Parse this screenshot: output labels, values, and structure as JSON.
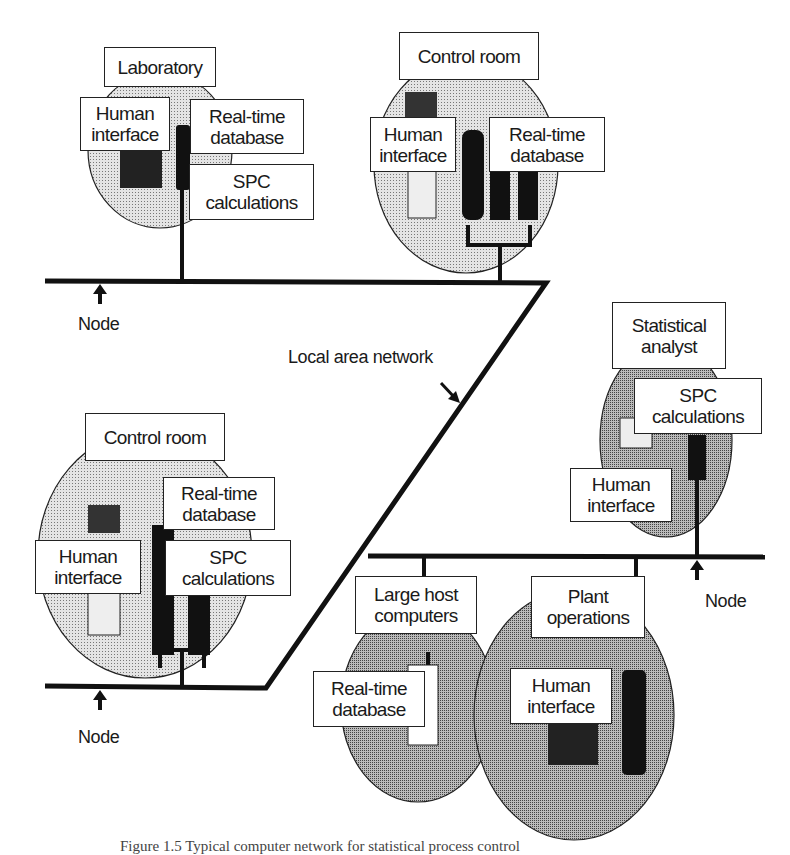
{
  "figure": {
    "colors": {
      "line": "#111111",
      "fill_light": "#c8c8c8",
      "fill_dark": "#8c8c8c",
      "label_bg": "#ffffff"
    },
    "network": {
      "label": "Local area network"
    },
    "nodes": [
      {
        "label": "Node"
      },
      {
        "label": "Node"
      },
      {
        "label": "Node"
      }
    ],
    "sites": {
      "laboratory": {
        "title": "Laboratory",
        "components": [
          "Human\ninterface",
          "Real-time\ndatabase",
          "SPC\ncalculations"
        ]
      },
      "control_room_top": {
        "title": "Control room",
        "components": [
          "Human\ninterface",
          "Real-time\ndatabase"
        ]
      },
      "statistical_analyst": {
        "title": "Statistical\nanalyst",
        "components": [
          "SPC\ncalculations",
          "Human\ninterface"
        ]
      },
      "control_room_bottom": {
        "title": "Control room",
        "components": [
          "Real-time\ndatabase",
          "Human\ninterface",
          "SPC\ncalculations"
        ]
      },
      "large_host": {
        "title": "Large host\ncomputers",
        "components": [
          "Real-time\ndatabase"
        ]
      },
      "plant_operations": {
        "title": "Plant\noperations",
        "components": [
          "Human\ninterface"
        ]
      }
    },
    "caption": "Figure 1.5  Typical computer network for statistical process control"
  }
}
